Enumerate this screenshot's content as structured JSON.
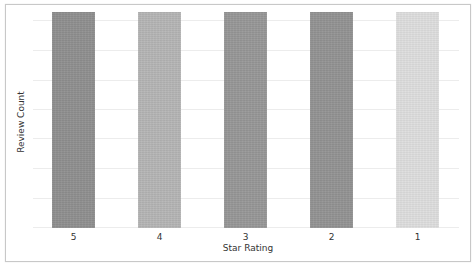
{
  "chart_data": {
    "type": "bar",
    "title": "",
    "xlabel": "Star Rating",
    "ylabel": "Review Count",
    "categories": [
      "5",
      "4",
      "3",
      "2",
      "1"
    ],
    "values": [
      1,
      1,
      1,
      1,
      1
    ],
    "values_note": "Y-axis has no tick labels; all bars are equal in height (relative units).",
    "colors": [
      "#8f8f8f",
      "#b5b5b5",
      "#979797",
      "#939393",
      "#dedede"
    ],
    "ylim": [
      0,
      1
    ],
    "yticks_visible": false,
    "grid": {
      "y": true,
      "x": false,
      "color": "#ececec"
    },
    "legend": null
  }
}
